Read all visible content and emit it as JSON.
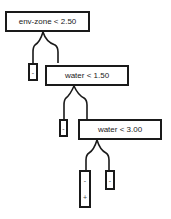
{
  "tree": {
    "nodes": [
      {
        "id": "root",
        "label": "env-zone < 2.50"
      },
      {
        "id": "n2",
        "label": "water < 1.50"
      },
      {
        "id": "n3",
        "label": "water < 3.00"
      }
    ],
    "leaves": [
      {
        "id": "leaf1",
        "symbols": [
          "-"
        ]
      },
      {
        "id": "leaf2",
        "symbols": [
          "-"
        ]
      },
      {
        "id": "leaf3",
        "symbols": [
          "-",
          "+"
        ]
      },
      {
        "id": "leaf4",
        "symbols": [
          "-"
        ]
      }
    ]
  }
}
